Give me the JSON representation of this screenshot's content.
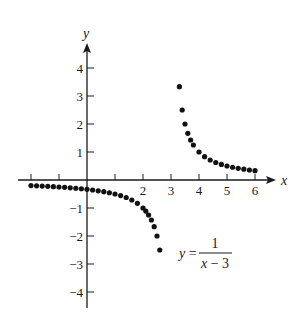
{
  "chart_data": {
    "type": "scatter",
    "title": "",
    "xlabel": "x",
    "ylabel": "y",
    "xlim": [
      -2.2,
      6.8
    ],
    "ylim": [
      -4.6,
      4.9
    ],
    "grid": false,
    "x_ticks": [
      -2,
      -1,
      1,
      2,
      3,
      4,
      5,
      6
    ],
    "x_tick_labels": [
      "",
      "",
      "",
      "2",
      "3",
      "4",
      "5",
      "6"
    ],
    "y_ticks": [
      4,
      3,
      2,
      1,
      -1,
      -2,
      -3,
      -4
    ],
    "y_tick_labels": [
      "4",
      "3",
      "2",
      "1",
      "−1",
      "−2",
      "−3",
      "−4"
    ],
    "annotation": {
      "text": "y = 1/(x − 3)",
      "lhs": "y =",
      "numerator": "1",
      "denominator": "x − 3",
      "position": [
        4.0,
        -2.5
      ]
    },
    "series": [
      {
        "name": "left branch",
        "color": "#111111",
        "x": [
          -2.0,
          -1.8,
          -1.6,
          -1.4,
          -1.2,
          -1.0,
          -0.8,
          -0.6,
          -0.4,
          -0.2,
          0.0,
          0.2,
          0.4,
          0.6,
          0.8,
          1.0,
          1.2,
          1.4,
          1.6,
          1.8,
          2.0,
          2.1,
          2.2,
          2.3,
          2.4,
          2.5,
          2.6
        ],
        "y": [
          -0.2,
          -0.208,
          -0.217,
          -0.227,
          -0.238,
          -0.25,
          -0.263,
          -0.278,
          -0.294,
          -0.313,
          -0.333,
          -0.357,
          -0.385,
          -0.417,
          -0.455,
          -0.5,
          -0.556,
          -0.625,
          -0.714,
          -0.833,
          -1.0,
          -1.111,
          -1.25,
          -1.429,
          -1.667,
          -2.0,
          -2.5
        ]
      },
      {
        "name": "right branch",
        "color": "#111111",
        "x": [
          3.3,
          3.4,
          3.5,
          3.6,
          3.7,
          3.8,
          4.0,
          4.2,
          4.4,
          4.6,
          4.8,
          5.0,
          5.2,
          5.4,
          5.6,
          5.8,
          6.0
        ],
        "y": [
          3.333,
          2.5,
          2.0,
          1.667,
          1.429,
          1.25,
          1.0,
          0.833,
          0.714,
          0.625,
          0.556,
          0.5,
          0.455,
          0.417,
          0.385,
          0.357,
          0.333
        ]
      }
    ]
  }
}
